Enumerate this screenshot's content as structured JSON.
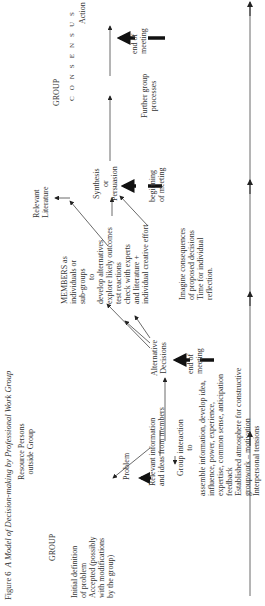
{
  "figure": {
    "number": "Figure 6",
    "title": "A Model of Decision-making by Professional Work Group"
  },
  "labels": {
    "resource_persons": [
      "Resource Persons",
      "outside Group"
    ],
    "group_left": "GROUP",
    "initial_definition": [
      "Initial definition",
      "of problem",
      "Accepted (possibly",
      "with modifications",
      "by the group)"
    ],
    "problem": "Problem",
    "relevant_information": [
      "Relevant information",
      "and ideas from members"
    ],
    "group_interaction": [
      "Group interaction",
      "to"
    ],
    "group_interaction_detail": [
      "assemble information, develop idea,",
      "influence, power, experience,",
      "expertise, common sense, anticipation",
      "feedback",
      "Established atmosphere for constructive",
      "groupwork – motivation",
      "Interpersonal tensions"
    ],
    "alternative_decisions": [
      "Alternative",
      "Decisions"
    ],
    "end_of_meeting_1": [
      "end of",
      "meeting"
    ],
    "members": [
      "MEMBERS as",
      "individuals or",
      "sub-groups",
      "to",
      "develop alternatives",
      "explore likely outcomes",
      "test reactions",
      "check with experts",
      "and literature +",
      "individual creative  effort"
    ],
    "imagine": [
      "Imagine consequences",
      "of proposed decisions",
      "Time for individual",
      "reflection."
    ],
    "relevant_literature": [
      "Relevant",
      "Literature"
    ],
    "synthesis": [
      "Synthesis",
      "or",
      "Persuasion"
    ],
    "beginning_of_meeting": [
      "beginning",
      "of meeting"
    ],
    "group_right": "GROUP",
    "consensus_letters": [
      "C",
      "O",
      "N",
      "S",
      "E",
      "N",
      "S",
      "U",
      "S"
    ],
    "further_group": [
      "Further group",
      "processes"
    ],
    "action": "Action",
    "end_of_meeting_2": [
      "end of",
      "meeting"
    ]
  }
}
